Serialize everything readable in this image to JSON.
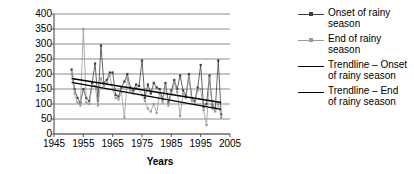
{
  "chart_data": {
    "type": "line",
    "title": "",
    "xlabel": "Years",
    "ylabel": "Annual rainfall (mm)",
    "xlim": [
      1945,
      2005
    ],
    "ylim": [
      0,
      400
    ],
    "xticks": [
      "1945",
      "1955",
      "1965",
      "1975",
      "1985",
      "1995",
      "2005"
    ],
    "yticks": [
      "0",
      "50",
      "100",
      "150",
      "200",
      "250",
      "300",
      "350",
      "400"
    ],
    "grid": "horizontal",
    "legend_position": "right",
    "colors": {
      "onset": "#3f3f3f",
      "end": "#9a9a9a",
      "trendline_onset": "#000000",
      "trendline_end": "#000000",
      "gridline": "#8c8c8c",
      "axis": "#595959"
    },
    "x": [
      1951,
      1952,
      1953,
      1954,
      1955,
      1956,
      1957,
      1958,
      1959,
      1960,
      1961,
      1962,
      1963,
      1964,
      1965,
      1966,
      1967,
      1968,
      1969,
      1970,
      1971,
      1972,
      1973,
      1974,
      1975,
      1976,
      1977,
      1978,
      1979,
      1980,
      1981,
      1982,
      1983,
      1984,
      1985,
      1986,
      1987,
      1988,
      1989,
      1990,
      1991,
      1992,
      1993,
      1994,
      1995,
      1996,
      1997,
      1998,
      1999,
      2000,
      2001,
      2002
    ],
    "series": [
      {
        "name": "Onset of rainy season",
        "marker": "dot",
        "values": [
          215,
          150,
          120,
          105,
          150,
          120,
          110,
          170,
          235,
          110,
          295,
          170,
          180,
          205,
          205,
          130,
          125,
          155,
          175,
          200,
          155,
          145,
          165,
          160,
          245,
          120,
          165,
          135,
          170,
          155,
          150,
          115,
          170,
          105,
          145,
          180,
          150,
          195,
          145,
          130,
          200,
          120,
          110,
          155,
          230,
          90,
          100,
          195,
          95,
          85,
          245,
          65
        ]
      },
      {
        "name": "End of rainy season",
        "marker": "dot",
        "values": [
          200,
          135,
          105,
          95,
          350,
          105,
          100,
          160,
          160,
          95,
          185,
          160,
          170,
          195,
          150,
          120,
          115,
          140,
          55,
          185,
          145,
          135,
          155,
          150,
          130,
          110,
          85,
          75,
          100,
          70,
          135,
          105,
          160,
          95,
          135,
          170,
          140,
          60,
          135,
          120,
          190,
          110,
          100,
          145,
          150,
          80,
          30,
          185,
          85,
          75,
          100,
          55
        ]
      }
    ],
    "trendlines": [
      {
        "name": "Trendline – Onset of rainy season",
        "x": [
          1951,
          2002
        ],
        "values": [
          185,
          105
        ]
      },
      {
        "name": "Trendline – End of rainy season",
        "x": [
          1951,
          2002
        ],
        "values": [
          172,
          82
        ]
      }
    ],
    "legend": [
      {
        "label_line1": "Onset of rainy",
        "label_line2": "season",
        "type": "line-marker",
        "color": "#3f3f3f"
      },
      {
        "label_line1": "End of rainy",
        "label_line2": "season",
        "type": "line-marker",
        "color": "#9a9a9a"
      },
      {
        "label_line1": "Trendline – Onset",
        "label_line2": "of rainy season",
        "type": "line",
        "color": "#000000"
      },
      {
        "label_line1": "Trendline – End",
        "label_line2": "of rainy season",
        "type": "line",
        "color": "#000000"
      }
    ]
  }
}
